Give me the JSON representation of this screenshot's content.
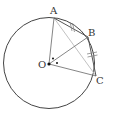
{
  "diagram": {
    "type": "geometry-circle",
    "points": {
      "A": {
        "label": "A",
        "x": 54,
        "y": 18,
        "label_x": 50,
        "label_y": 14
      },
      "B": {
        "label": "B",
        "x": 88,
        "y": 37,
        "label_x": 88,
        "label_y": 36
      },
      "C": {
        "label": "C",
        "x": 96,
        "y": 76,
        "label_x": 96,
        "label_y": 84
      },
      "O": {
        "label": "O",
        "x": 49,
        "y": 64,
        "label_x": 38,
        "label_y": 68
      }
    },
    "circle": {
      "cx": 49,
      "cy": 63,
      "r": 46
    },
    "segments": [
      "OA",
      "OB",
      "OC",
      "AB",
      "BC",
      "AC"
    ],
    "equal_marks": [
      "AB",
      "BC"
    ],
    "angle_marks": [
      "AOB",
      "BOC"
    ],
    "colors": {
      "circle": "#444444",
      "line": "#777777",
      "light_line": "#bbbbbb",
      "label": "#333333"
    }
  }
}
